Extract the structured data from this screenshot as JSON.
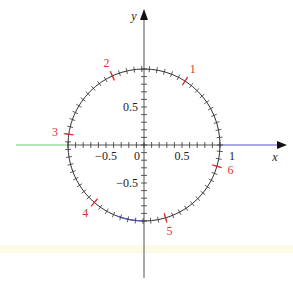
{
  "diagram": {
    "width": 293,
    "height": 290,
    "center": {
      "x": 144,
      "y": 145
    },
    "radius": 76,
    "colors": {
      "axis": "#555555",
      "circle": "#333333",
      "radian_mark": "#e03030",
      "left_axis_segment": "#66cc66",
      "right_axis_segment": "#5555cc",
      "arc_highlight": "#5555cc",
      "pale_band": "#fbfbe6"
    },
    "axes": {
      "x_label": "x",
      "y_label": "y",
      "x_ticks": [
        {
          "value": -0.5,
          "label": "−0.5"
        },
        {
          "value": 0,
          "label": "0"
        },
        {
          "value": 0.5,
          "label": "0.5"
        },
        {
          "value": 1,
          "label": "1"
        }
      ],
      "y_ticks": [
        {
          "value": 0.5,
          "label": "0.5"
        },
        {
          "value": -0.5,
          "label": "−0.5"
        }
      ],
      "minor_tick_step": 0.1
    },
    "circle_ticks": {
      "count": 63,
      "step_radians": 0.1
    },
    "radian_marks": [
      {
        "value": 1,
        "label": "1"
      },
      {
        "value": 2,
        "label": "2"
      },
      {
        "value": 3,
        "label": "3"
      },
      {
        "value": 4,
        "label": "4"
      },
      {
        "value": 5,
        "label": "5"
      },
      {
        "value": 6,
        "label": "6"
      }
    ]
  }
}
